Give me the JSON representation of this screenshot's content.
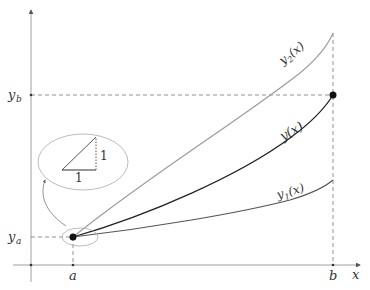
{
  "diagram": {
    "type": "shooting-method / bracketing solutions of a boundary value problem",
    "axes": {
      "x_label": "x",
      "y_label": "",
      "x_ticks": [
        {
          "label": "a",
          "x": 73
        },
        {
          "label": "b",
          "x": 333
        }
      ],
      "y_ticks": [
        {
          "label": "y_b",
          "base": "y",
          "sub": "b",
          "y": 95
        },
        {
          "label": "y_a",
          "base": "y",
          "sub": "a",
          "y": 237
        }
      ]
    },
    "curves": [
      {
        "name": "y2",
        "label": "y₂(x)",
        "base": "y",
        "sub": "2",
        "arg": "(x)",
        "color": "#9a9a9a",
        "description": "upper trial solution, overshoots y_b"
      },
      {
        "name": "y",
        "label": "y(x)",
        "base": "y",
        "sub": "",
        "arg": "(x)",
        "color": "#222222",
        "description": "true solution reaching (b, y_b)"
      },
      {
        "name": "y1",
        "label": "y₁(x)",
        "base": "y",
        "sub": "1",
        "arg": "(x)",
        "color": "#555555",
        "description": "lower trial solution, undershoots y_b"
      }
    ],
    "points": [
      {
        "name": "start-point",
        "label": "(a, y_a)"
      },
      {
        "name": "end-point",
        "label": "(b, y_b)"
      }
    ],
    "inset": {
      "description": "magnified slope triangle at start point",
      "horizontal_leg_label": "1",
      "vertical_leg_label": "1"
    },
    "colors": {
      "axis": "#888888",
      "dashed": "#777777",
      "point": "#111111",
      "ellipse": "#aaaaaa"
    }
  }
}
